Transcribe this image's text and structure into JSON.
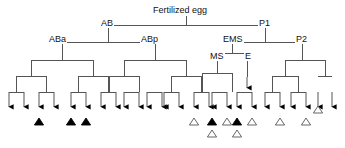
{
  "figure": {
    "line_color": "#555555",
    "marker_fill_color": "#000000",
    "marker_open_color": "#ffffff",
    "marker_stroke_color": "#555555",
    "text_color": "#111111"
  },
  "labels": [
    {
      "id": "fertilized-egg",
      "text": "Fertilized egg",
      "x": 152,
      "y": 5
    },
    {
      "id": "ab",
      "text": "AB",
      "x": 100,
      "y": 18
    },
    {
      "id": "p1",
      "text": "P1",
      "x": 258,
      "y": 18
    },
    {
      "id": "aba",
      "text": "ABa",
      "x": 48,
      "y": 34
    },
    {
      "id": "abp",
      "text": "ABp",
      "x": 140,
      "y": 34
    },
    {
      "id": "ems",
      "text": "EMS",
      "x": 222,
      "y": 34
    },
    {
      "id": "p2",
      "text": "P2",
      "x": 295,
      "y": 34
    },
    {
      "id": "ms",
      "text": "MS",
      "x": 209,
      "y": 51
    },
    {
      "id": "e",
      "text": "E",
      "x": 244,
      "y": 51
    }
  ],
  "edges": [
    {
      "name": "root-stem",
      "x1": 186,
      "y1": 16,
      "x2": 186,
      "y2": 25
    },
    {
      "name": "root-bar",
      "x1": 108,
      "y1": 25,
      "x2": 265,
      "y2": 25
    },
    {
      "name": "ab-stem",
      "x1": 108,
      "y1": 25,
      "x2": 108,
      "y2": 42
    },
    {
      "name": "ab-bar",
      "x1": 62,
      "y1": 42,
      "x2": 155,
      "y2": 42
    },
    {
      "name": "p1-stem",
      "x1": 265,
      "y1": 25,
      "x2": 265,
      "y2": 42
    },
    {
      "name": "p1-bar",
      "x1": 232,
      "y1": 42,
      "x2": 302,
      "y2": 42
    },
    {
      "name": "aba-stem",
      "x1": 62,
      "y1": 42,
      "x2": 62,
      "y2": 60
    },
    {
      "name": "aba-bar",
      "x1": 31,
      "y1": 60,
      "x2": 93,
      "y2": 60
    },
    {
      "name": "abp-stem",
      "x1": 155,
      "y1": 42,
      "x2": 155,
      "y2": 60
    },
    {
      "name": "abp-bar",
      "x1": 124,
      "y1": 60,
      "x2": 186,
      "y2": 60
    },
    {
      "name": "ems-stem",
      "x1": 232,
      "y1": 42,
      "x2": 232,
      "y2": 53
    },
    {
      "name": "ems-bar",
      "x1": 217,
      "y1": 53,
      "x2": 247,
      "y2": 53
    },
    {
      "name": "p2-stem",
      "x1": 302,
      "y1": 42,
      "x2": 302,
      "y2": 60
    },
    {
      "name": "p2-bar",
      "x1": 285,
      "y1": 60,
      "x2": 325,
      "y2": 60
    },
    {
      "name": "ms-stem",
      "x1": 217,
      "y1": 53,
      "x2": 217,
      "y2": 73
    },
    {
      "name": "ms-bar",
      "x1": 202,
      "y1": 73,
      "x2": 232,
      "y2": 73
    },
    {
      "name": "e-stem",
      "x1": 247,
      "y1": 53,
      "x2": 247,
      "y2": 77
    },
    {
      "name": "aba-l-stem",
      "x1": 31,
      "y1": 60,
      "x2": 31,
      "y2": 76
    },
    {
      "name": "aba-l-bar",
      "x1": 16,
      "y1": 76,
      "x2": 46,
      "y2": 76
    },
    {
      "name": "aba-r-stem",
      "x1": 93,
      "y1": 60,
      "x2": 93,
      "y2": 76
    },
    {
      "name": "aba-r-bar",
      "x1": 78,
      "y1": 76,
      "x2": 108,
      "y2": 76
    },
    {
      "name": "abp-l-stem",
      "x1": 124,
      "y1": 60,
      "x2": 124,
      "y2": 76
    },
    {
      "name": "abp-l-bar",
      "x1": 109,
      "y1": 76,
      "x2": 139,
      "y2": 76
    },
    {
      "name": "abp-r-stem",
      "x1": 186,
      "y1": 60,
      "x2": 186,
      "y2": 76
    },
    {
      "name": "abp-r-bar",
      "x1": 171,
      "y1": 76,
      "x2": 201,
      "y2": 76
    },
    {
      "name": "p2-l-stem",
      "x1": 285,
      "y1": 60,
      "x2": 285,
      "y2": 76
    },
    {
      "name": "p2-l-bar",
      "x1": 272,
      "y1": 76,
      "x2": 298,
      "y2": 76
    },
    {
      "name": "p2-r-stem",
      "x1": 325,
      "y1": 60,
      "x2": 325,
      "y2": 76
    },
    {
      "name": "p2-r-bar",
      "x1": 318,
      "y1": 76,
      "x2": 332,
      "y2": 76
    },
    {
      "name": "t1-stem",
      "x1": 16,
      "y1": 76,
      "x2": 16,
      "y2": 92
    },
    {
      "name": "t1-bar",
      "x1": 9,
      "y1": 92,
      "x2": 24,
      "y2": 92
    },
    {
      "name": "t2-stem",
      "x1": 46,
      "y1": 76,
      "x2": 46,
      "y2": 92
    },
    {
      "name": "t2-bar",
      "x1": 39,
      "y1": 92,
      "x2": 54,
      "y2": 92
    },
    {
      "name": "t3-stem",
      "x1": 78,
      "y1": 76,
      "x2": 78,
      "y2": 92
    },
    {
      "name": "t3-bar",
      "x1": 71,
      "y1": 92,
      "x2": 86,
      "y2": 92
    },
    {
      "name": "t4-stem",
      "x1": 108,
      "y1": 76,
      "x2": 108,
      "y2": 92
    },
    {
      "name": "t4-bar",
      "x1": 101,
      "y1": 92,
      "x2": 116,
      "y2": 92
    },
    {
      "name": "t5-stem",
      "x1": 109,
      "y1": 76,
      "x2": 109,
      "y2": 92
    },
    {
      "name": "t5-bar",
      "x1": 124,
      "y1": 92,
      "x2": 139,
      "y2": 92
    },
    {
      "name": "t6-stem",
      "x1": 139,
      "y1": 76,
      "x2": 139,
      "y2": 92
    },
    {
      "name": "t6-bar",
      "x1": 147,
      "y1": 92,
      "x2": 162,
      "y2": 92
    },
    {
      "name": "t7-stem",
      "x1": 171,
      "y1": 76,
      "x2": 171,
      "y2": 92
    },
    {
      "name": "t7-bar",
      "x1": 164,
      "y1": 92,
      "x2": 179,
      "y2": 92
    },
    {
      "name": "t8-stem",
      "x1": 201,
      "y1": 76,
      "x2": 201,
      "y2": 92
    },
    {
      "name": "t8-bar",
      "x1": 194,
      "y1": 92,
      "x2": 209,
      "y2": 92
    },
    {
      "name": "ms-l-stem",
      "x1": 202,
      "y1": 73,
      "x2": 202,
      "y2": 92
    },
    {
      "name": "ms-l-bar",
      "x1": 212,
      "y1": 92,
      "x2": 227,
      "y2": 92
    },
    {
      "name": "ms-r-stem",
      "x1": 232,
      "y1": 73,
      "x2": 232,
      "y2": 92
    },
    {
      "name": "ms-r-bar",
      "x1": 237,
      "y1": 92,
      "x2": 252,
      "y2": 92
    },
    {
      "name": "p2a-stem",
      "x1": 272,
      "y1": 76,
      "x2": 272,
      "y2": 92
    },
    {
      "name": "p2a-bar",
      "x1": 265,
      "y1": 92,
      "x2": 280,
      "y2": 92
    },
    {
      "name": "p2b-stem",
      "x1": 298,
      "y1": 76,
      "x2": 298,
      "y2": 92
    },
    {
      "name": "p2b-bar",
      "x1": 291,
      "y1": 92,
      "x2": 306,
      "y2": 92
    }
  ],
  "arrows": {
    "top_y": 92,
    "tip_y": 112,
    "xs": [
      9,
      24,
      39,
      54,
      71,
      86,
      101,
      116,
      124,
      139,
      147,
      162,
      164,
      179,
      194,
      209,
      212,
      227,
      237,
      252,
      265,
      280,
      291,
      306,
      318,
      332
    ],
    "single_arrows": [
      {
        "name": "e-lineage-arrow",
        "x": 247,
        "y1": 77,
        "y2": 93
      }
    ]
  },
  "markers": [
    {
      "name": "marker-filled-aba-1",
      "x": 39,
      "y": 125,
      "fill": "filled"
    },
    {
      "name": "marker-filled-aba-2",
      "x": 71,
      "y": 125,
      "fill": "filled"
    },
    {
      "name": "marker-filled-aba-3",
      "x": 86,
      "y": 125,
      "fill": "filled"
    },
    {
      "name": "marker-open-abp-1",
      "x": 194,
      "y": 125,
      "fill": "open"
    },
    {
      "name": "marker-filled-ms-1",
      "x": 212,
      "y": 125,
      "fill": "filled"
    },
    {
      "name": "marker-open-ms-1",
      "x": 227,
      "y": 125,
      "fill": "open"
    },
    {
      "name": "marker-filled-ms-2",
      "x": 237,
      "y": 125,
      "fill": "filled"
    },
    {
      "name": "marker-open-ms-2",
      "x": 252,
      "y": 125,
      "fill": "open"
    },
    {
      "name": "marker-open-ms-3",
      "x": 212,
      "y": 137,
      "fill": "open"
    },
    {
      "name": "marker-open-ms-4",
      "x": 237,
      "y": 137,
      "fill": "open"
    },
    {
      "name": "marker-open-p2-1",
      "x": 280,
      "y": 125,
      "fill": "open"
    },
    {
      "name": "marker-open-p2-2",
      "x": 306,
      "y": 125,
      "fill": "open"
    },
    {
      "name": "marker-open-p2-3",
      "x": 318,
      "y": 113,
      "fill": "open"
    }
  ]
}
